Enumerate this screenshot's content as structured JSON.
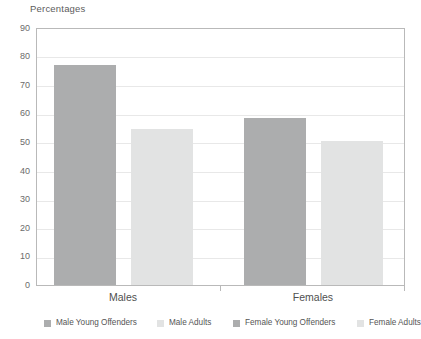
{
  "chart_data": {
    "type": "bar",
    "title": "Percentages",
    "xlabel": "",
    "ylabel": "",
    "ylim": [
      0,
      90
    ],
    "yticks": [
      0,
      10,
      20,
      30,
      40,
      50,
      60,
      70,
      80,
      90
    ],
    "grid": true,
    "legend_position": "bottom",
    "categories": [
      "Males",
      "Females"
    ],
    "bars": [
      {
        "label": "Male Young Offenders",
        "group": "Males",
        "value": 76.8,
        "color": "#acadae"
      },
      {
        "label": "Male Adults",
        "group": "Males",
        "value": 54.5,
        "color": "#e2e3e3"
      },
      {
        "label": "Female Young Offenders",
        "group": "Females",
        "value": 58.2,
        "color": "#acadae"
      },
      {
        "label": "Female Adults",
        "group": "Females",
        "value": 50.2,
        "color": "#e2e3e3"
      }
    ],
    "legend": [
      {
        "label": "Male Young Offenders",
        "color": "#acadae"
      },
      {
        "label": "Male Adults",
        "color": "#e2e3e3"
      },
      {
        "label": "Female Young Offenders",
        "color": "#acadae"
      },
      {
        "label": "Female Adults",
        "color": "#e2e3e3"
      }
    ]
  },
  "colors": {
    "bar_dark": "#acadae",
    "bar_light": "#e2e3e3",
    "gridline": "#e8e8e8",
    "frame": "#b9b9b9",
    "text": "#4f4f4f",
    "background": "#ffffff"
  },
  "axis": {
    "ytick_0": "0",
    "ytick_10": "10",
    "ytick_20": "20",
    "ytick_30": "30",
    "ytick_40": "40",
    "ytick_50": "50",
    "ytick_60": "60",
    "ytick_70": "70",
    "ytick_80": "80",
    "ytick_90": "90"
  }
}
